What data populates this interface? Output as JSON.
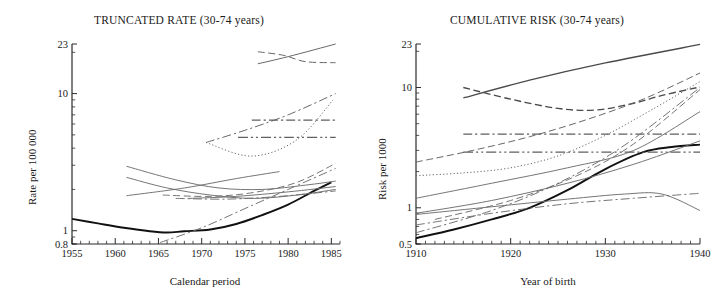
{
  "figure": {
    "width": 716,
    "height": 298,
    "background": "#ffffff",
    "ink_color": "#1a1a1a",
    "line_color_gray": "#6e6e6e",
    "line_color_dark": "#111111"
  },
  "panels": [
    {
      "id": "truncated-rate",
      "title": "TRUNCATED RATE (30-74 years)",
      "xlabel": "Calendar period",
      "ylabel": "Rate per 100 000",
      "x_ticks": [
        "1955",
        "1960",
        "1965",
        "1970",
        "1975",
        "1980",
        "1985"
      ],
      "y_ticks": [
        "23",
        "10",
        "1",
        "0.8"
      ]
    },
    {
      "id": "cumulative-risk",
      "title": "CUMULATIVE RISK (30-74 years)",
      "xlabel": "Year of birth",
      "ylabel": "Risk per 1000",
      "x_ticks": [
        "1910",
        "1920",
        "1930",
        "1940"
      ],
      "y_ticks": [
        "23",
        "10",
        "1",
        "0.5"
      ]
    }
  ],
  "chart_data": [
    {
      "type": "line",
      "id": "truncated-rate",
      "title": "TRUNCATED RATE (30-74 years)",
      "xlabel": "Calendar period",
      "ylabel": "Rate per 100 000",
      "xlim": [
        1955,
        1986
      ],
      "ylim": [
        0.8,
        23
      ],
      "yscale": "log",
      "xscale": "linear",
      "grid": false,
      "legend": "none",
      "xticks": [
        1955,
        1960,
        1965,
        1970,
        1975,
        1980,
        1985
      ],
      "xticklabels": [
        "1955",
        "1960",
        "1965",
        "1970",
        "1975",
        "1980",
        "1985"
      ],
      "yticks": [
        0.8,
        1,
        10,
        23
      ],
      "yticklabels": [
        "0.8",
        "1",
        "10",
        "23"
      ],
      "series": [
        {
          "name": "series-a-heavy-solid",
          "style": "solid",
          "weight": "heavy",
          "color": "#111111",
          "x": [
            1955,
            1958,
            1961,
            1964,
            1966,
            1968,
            1971,
            1974,
            1977,
            1980,
            1983,
            1985
          ],
          "y": [
            1.22,
            1.13,
            1.05,
            0.99,
            0.97,
            0.99,
            1.02,
            1.12,
            1.3,
            1.55,
            1.95,
            2.25
          ]
        },
        {
          "name": "series-b-solid-top-rising",
          "style": "solid",
          "weight": "light",
          "color": "#5f5f5f",
          "x": [
            1976.5,
            1980,
            1985.5
          ],
          "y": [
            16.5,
            18.6,
            23.0
          ]
        },
        {
          "name": "series-c-dashed-top-flat",
          "style": "dashed",
          "weight": "light",
          "color": "#5f5f5f",
          "x": [
            1976.5,
            1979.5,
            1982,
            1985.5
          ],
          "y": [
            20.2,
            19.0,
            17.1,
            16.8
          ]
        },
        {
          "name": "series-d-dashdot-rising",
          "style": "dashdot",
          "weight": "light",
          "color": "#5f5f5f",
          "x": [
            1970.5,
            1975,
            1980,
            1985.5
          ],
          "y": [
            4.4,
            5.4,
            7.0,
            10.0
          ]
        },
        {
          "name": "series-e-dashdot-horizontal-upper",
          "style": "dashdot",
          "weight": "medium",
          "color": "#5f5f5f",
          "x": [
            1975.8,
            1980,
            1985.5
          ],
          "y": [
            6.4,
            6.4,
            6.4
          ]
        },
        {
          "name": "series-f-dashdotdot-horizontal-lower",
          "style": "dashdotdot",
          "weight": "medium",
          "color": "#5f5f5f",
          "x": [
            1974.2,
            1980,
            1985.5
          ],
          "y": [
            4.8,
            4.8,
            4.8
          ]
        },
        {
          "name": "series-g-dotted-v",
          "style": "dotted",
          "weight": "light",
          "color": "#5f5f5f",
          "x": [
            1970.5,
            1975.8,
            1981,
            1985.2
          ],
          "y": [
            4.4,
            3.5,
            4.6,
            9.0
          ]
        },
        {
          "name": "series-h-solid-declining-mid",
          "style": "solid",
          "weight": "light",
          "color": "#6e6e6e",
          "x": [
            1961.3,
            1967,
            1972,
            1977,
            1982,
            1985.5
          ],
          "y": [
            2.95,
            2.35,
            2.05,
            2.0,
            2.15,
            2.3
          ]
        },
        {
          "name": "series-i-solid-declining-steep",
          "style": "solid",
          "weight": "light",
          "color": "#6e6e6e",
          "x": [
            1961.3,
            1966,
            1971,
            1976,
            1981,
            1985.5
          ],
          "y": [
            2.45,
            2.05,
            1.82,
            1.72,
            1.82,
            2.0
          ]
        },
        {
          "name": "series-j-solid-rising-mid",
          "style": "solid",
          "weight": "light",
          "color": "#6e6e6e",
          "x": [
            1961.3,
            1968,
            1974,
            1979
          ],
          "y": [
            1.8,
            2.05,
            2.4,
            2.7
          ]
        },
        {
          "name": "series-k-dashed-rising-low",
          "style": "dashed",
          "weight": "light",
          "color": "#6e6e6e",
          "x": [
            1965.5,
            1971,
            1976,
            1981,
            1985.5
          ],
          "y": [
            1.82,
            1.78,
            1.9,
            2.25,
            3.1
          ]
        },
        {
          "name": "series-l-dashdot-low-rising",
          "style": "dashdot",
          "weight": "light",
          "color": "#6e6e6e",
          "x": [
            1965.2,
            1970,
            1975,
            1980,
            1985.5
          ],
          "y": [
            0.82,
            1.05,
            1.45,
            2.0,
            2.85
          ]
        },
        {
          "name": "series-m-dashdot-horizontal-low",
          "style": "dashdot",
          "weight": "light",
          "color": "#6e6e6e",
          "x": [
            1967,
            1973,
            1979,
            1985.5
          ],
          "y": [
            1.72,
            1.7,
            1.78,
            1.95
          ]
        },
        {
          "name": "series-n-solid-flat-low",
          "style": "solid",
          "weight": "light",
          "color": "#6e6e6e",
          "x": [
            1968.5,
            1974,
            1980,
            1985.5
          ],
          "y": [
            1.72,
            1.78,
            1.92,
            2.1
          ]
        }
      ]
    },
    {
      "type": "line",
      "id": "cumulative-risk",
      "title": "CUMULATIVE RISK (30-74 years)",
      "xlabel": "Year of birth",
      "ylabel": "Risk per 1000",
      "xlim": [
        1910,
        1940
      ],
      "ylim": [
        0.5,
        23
      ],
      "yscale": "log",
      "xscale": "linear",
      "grid": false,
      "legend": "none",
      "xticks": [
        1910,
        1920,
        1930,
        1940
      ],
      "xticklabels": [
        "1910",
        "1920",
        "1930",
        "1940"
      ],
      "yticks": [
        0.5,
        1,
        10,
        23
      ],
      "yticklabels": [
        "0.5",
        "1",
        "10",
        "23"
      ],
      "series": [
        {
          "name": "series-a-heavy-solid",
          "style": "solid",
          "weight": "heavy",
          "color": "#111111",
          "x": [
            1910,
            1914,
            1918,
            1922,
            1926,
            1930,
            1934,
            1937,
            1940
          ],
          "y": [
            0.56,
            0.66,
            0.8,
            1.0,
            1.4,
            2.1,
            2.9,
            3.2,
            3.35
          ]
        },
        {
          "name": "series-b-solid-top-rising",
          "style": "solid",
          "weight": "medium",
          "color": "#4a4a4a",
          "x": [
            1915,
            1922,
            1930,
            1940
          ],
          "y": [
            8.2,
            11.5,
            16.0,
            22.8
          ]
        },
        {
          "name": "series-c-dashed-top-u",
          "style": "dashed",
          "weight": "medium",
          "color": "#4a4a4a",
          "x": [
            1915,
            1920,
            1925,
            1929,
            1933,
            1936,
            1940
          ],
          "y": [
            10.0,
            8.0,
            6.7,
            6.5,
            7.4,
            8.6,
            10.1
          ]
        },
        {
          "name": "series-d-dashed-rising-steep",
          "style": "dashed",
          "weight": "light",
          "color": "#5f5f5f",
          "x": [
            1910,
            1916,
            1922,
            1928,
            1934,
            1940
          ],
          "y": [
            2.4,
            3.0,
            3.9,
            5.4,
            8.0,
            13.2
          ]
        },
        {
          "name": "series-e-dotted-rising",
          "style": "dotted",
          "weight": "light",
          "color": "#5f5f5f",
          "x": [
            1910,
            1915,
            1920,
            1925,
            1930,
            1935,
            1940
          ],
          "y": [
            1.85,
            1.95,
            2.15,
            2.7,
            4.0,
            6.6,
            11.2
          ]
        },
        {
          "name": "series-f-dashdot-horizontal-upper",
          "style": "dashdot",
          "weight": "medium",
          "color": "#5f5f5f",
          "x": [
            1915,
            1925,
            1935,
            1940
          ],
          "y": [
            4.1,
            4.1,
            4.1,
            4.1
          ]
        },
        {
          "name": "series-g-dashdotdot-horizontal-lower",
          "style": "dashdotdot",
          "weight": "medium",
          "color": "#5f5f5f",
          "x": [
            1915,
            1925,
            1935,
            1940
          ],
          "y": [
            2.9,
            2.9,
            2.9,
            2.9
          ]
        },
        {
          "name": "series-h-dashdot-rising-mid",
          "style": "dashdot",
          "weight": "light",
          "color": "#6e6e6e",
          "x": [
            1910,
            1918,
            1925,
            1932,
            1940
          ],
          "y": [
            0.62,
            0.95,
            1.6,
            3.3,
            10.0
          ]
        },
        {
          "name": "series-i-solid-rising-mid",
          "style": "solid",
          "weight": "light",
          "color": "#6e6e6e",
          "x": [
            1910,
            1918,
            1926,
            1933,
            1940
          ],
          "y": [
            1.2,
            1.6,
            2.15,
            3.0,
            6.3
          ]
        },
        {
          "name": "series-j-solid-rising-lower",
          "style": "solid",
          "weight": "light",
          "color": "#6e6e6e",
          "x": [
            1910,
            1918,
            1926,
            1933,
            1940
          ],
          "y": [
            0.9,
            1.15,
            1.6,
            2.3,
            3.6
          ]
        },
        {
          "name": "series-k-solid-flat-declining",
          "style": "solid",
          "weight": "light",
          "color": "#6e6e6e",
          "x": [
            1910,
            1918,
            1926,
            1932,
            1936,
            1940
          ],
          "y": [
            0.88,
            1.02,
            1.18,
            1.3,
            1.3,
            0.95
          ]
        },
        {
          "name": "series-l-dashdot-flat-low",
          "style": "dashdot",
          "weight": "light",
          "color": "#6e6e6e",
          "x": [
            1910,
            1918,
            1926,
            1933,
            1940
          ],
          "y": [
            0.72,
            0.9,
            1.08,
            1.2,
            1.32
          ]
        },
        {
          "name": "series-m-dashed-rising-low",
          "style": "dashed",
          "weight": "light",
          "color": "#6e6e6e",
          "x": [
            1912,
            1920,
            1927,
            1933,
            1940
          ],
          "y": [
            0.8,
            1.15,
            1.85,
            3.4,
            9.6
          ]
        }
      ]
    }
  ]
}
